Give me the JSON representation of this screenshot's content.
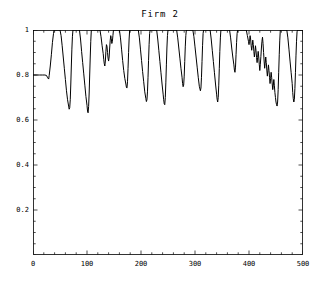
{
  "chart_data": {
    "type": "line",
    "title": "Firm 2",
    "xlabel": "",
    "ylabel": "",
    "xlim": [
      0,
      500
    ],
    "ylim": [
      0,
      1.0
    ],
    "grid": false,
    "legend": null,
    "line_color": "#000000",
    "background_color": "#ffffff",
    "frame_color": "#000000",
    "x_ticks": [
      0,
      100,
      200,
      300,
      400,
      500
    ],
    "x_tick_labels": [
      "0",
      "100",
      "200",
      "300",
      "400",
      "500"
    ],
    "x_minor_tick_step": 20,
    "y_ticks": [
      0.2,
      0.4,
      0.6,
      0.8,
      1.0
    ],
    "y_tick_labels": [
      "0.2",
      "0.4",
      "0.6",
      "0.8",
      "1"
    ],
    "y_minor_tick_step": 0.05,
    "series": [
      {
        "name": "Firm 2 capacity utilization",
        "points": [
          [
            0,
            0.8
          ],
          [
            6,
            0.8
          ],
          [
            12,
            0.8
          ],
          [
            18,
            0.8
          ],
          [
            22,
            0.8
          ],
          [
            25,
            0.798
          ],
          [
            27,
            0.788
          ],
          [
            29,
            0.782
          ],
          [
            30,
            0.798
          ],
          [
            32,
            0.84
          ],
          [
            34,
            0.89
          ],
          [
            36,
            0.945
          ],
          [
            38,
            0.985
          ],
          [
            39,
            1.0
          ],
          [
            42,
            1.0
          ],
          [
            46,
            1.0
          ],
          [
            50,
            1.0
          ],
          [
            52,
            0.975
          ],
          [
            54,
            0.93
          ],
          [
            56,
            0.88
          ],
          [
            58,
            0.83
          ],
          [
            60,
            0.78
          ],
          [
            62,
            0.73
          ],
          [
            64,
            0.69
          ],
          [
            66,
            0.662
          ],
          [
            67,
            0.648
          ],
          [
            68,
            0.655
          ],
          [
            69,
            0.69
          ],
          [
            70,
            0.76
          ],
          [
            71,
            0.84
          ],
          [
            72,
            0.915
          ],
          [
            73,
            0.97
          ],
          [
            74,
            1.0
          ],
          [
            78,
            1.0
          ],
          [
            82,
            1.0
          ],
          [
            86,
            1.0
          ],
          [
            88,
            0.96
          ],
          [
            90,
            0.905
          ],
          [
            92,
            0.855
          ],
          [
            94,
            0.805
          ],
          [
            96,
            0.755
          ],
          [
            98,
            0.705
          ],
          [
            100,
            0.665
          ],
          [
            101,
            0.64
          ],
          [
            102,
            0.632
          ],
          [
            103,
            0.66
          ],
          [
            104,
            0.72
          ],
          [
            105,
            0.8
          ],
          [
            106,
            0.88
          ],
          [
            107,
            0.95
          ],
          [
            108,
            1.0
          ],
          [
            112,
            1.0
          ],
          [
            116,
            1.0
          ],
          [
            120,
            1.0
          ],
          [
            124,
            1.0
          ],
          [
            126,
            0.97
          ],
          [
            128,
            0.93
          ],
          [
            130,
            0.895
          ],
          [
            131,
            0.87
          ],
          [
            132,
            0.85
          ],
          [
            133,
            0.84
          ],
          [
            134,
            0.862
          ],
          [
            135,
            0.905
          ],
          [
            136,
            0.935
          ],
          [
            137,
            0.928
          ],
          [
            138,
            0.9
          ],
          [
            139,
            0.875
          ],
          [
            140,
            0.862
          ],
          [
            141,
            0.88
          ],
          [
            142,
            0.92
          ],
          [
            143,
            0.955
          ],
          [
            144,
            0.975
          ],
          [
            145,
            0.962
          ],
          [
            146,
            0.94
          ],
          [
            147,
            0.95
          ],
          [
            148,
            0.975
          ],
          [
            149,
            1.0
          ],
          [
            152,
            1.0
          ],
          [
            156,
            1.0
          ],
          [
            160,
            1.0
          ],
          [
            162,
            0.965
          ],
          [
            164,
            0.915
          ],
          [
            166,
            0.865
          ],
          [
            168,
            0.82
          ],
          [
            170,
            0.785
          ],
          [
            172,
            0.76
          ],
          [
            173,
            0.745
          ],
          [
            174,
            0.742
          ],
          [
            175,
            0.77
          ],
          [
            176,
            0.83
          ],
          [
            177,
            0.9
          ],
          [
            178,
            0.96
          ],
          [
            179,
            1.0
          ],
          [
            183,
            1.0
          ],
          [
            187,
            1.0
          ],
          [
            191,
            1.0
          ],
          [
            195,
            1.0
          ],
          [
            197,
            0.965
          ],
          [
            199,
            0.915
          ],
          [
            201,
            0.865
          ],
          [
            203,
            0.815
          ],
          [
            205,
            0.77
          ],
          [
            207,
            0.725
          ],
          [
            209,
            0.695
          ],
          [
            210,
            0.682
          ],
          [
            211,
            0.69
          ],
          [
            212,
            0.725
          ],
          [
            213,
            0.79
          ],
          [
            214,
            0.865
          ],
          [
            215,
            0.935
          ],
          [
            216,
            0.985
          ],
          [
            217,
            1.0
          ],
          [
            221,
            1.0
          ],
          [
            225,
            1.0
          ],
          [
            229,
            1.0
          ],
          [
            231,
            0.96
          ],
          [
            233,
            0.91
          ],
          [
            235,
            0.86
          ],
          [
            237,
            0.81
          ],
          [
            239,
            0.76
          ],
          [
            241,
            0.715
          ],
          [
            242,
            0.69
          ],
          [
            243,
            0.672
          ],
          [
            244,
            0.668
          ],
          [
            245,
            0.7
          ],
          [
            246,
            0.765
          ],
          [
            247,
            0.845
          ],
          [
            248,
            0.92
          ],
          [
            249,
            0.975
          ],
          [
            250,
            1.0
          ],
          [
            254,
            1.0
          ],
          [
            258,
            1.0
          ],
          [
            262,
            1.0
          ],
          [
            266,
            1.0
          ],
          [
            268,
            0.965
          ],
          [
            270,
            0.92
          ],
          [
            272,
            0.875
          ],
          [
            274,
            0.83
          ],
          [
            276,
            0.79
          ],
          [
            277,
            0.762
          ],
          [
            278,
            0.748
          ],
          [
            279,
            0.755
          ],
          [
            280,
            0.795
          ],
          [
            281,
            0.86
          ],
          [
            282,
            0.925
          ],
          [
            283,
            0.975
          ],
          [
            284,
            1.0
          ],
          [
            288,
            1.0
          ],
          [
            292,
            1.0
          ],
          [
            296,
            1.0
          ],
          [
            298,
            0.97
          ],
          [
            300,
            0.925
          ],
          [
            302,
            0.88
          ],
          [
            304,
            0.835
          ],
          [
            306,
            0.79
          ],
          [
            308,
            0.75
          ],
          [
            310,
            0.73
          ],
          [
            311,
            0.742
          ],
          [
            312,
            0.79
          ],
          [
            313,
            0.86
          ],
          [
            314,
            0.93
          ],
          [
            315,
            0.985
          ],
          [
            316,
            1.0
          ],
          [
            320,
            1.0
          ],
          [
            324,
            1.0
          ],
          [
            328,
            1.0
          ],
          [
            330,
            0.96
          ],
          [
            332,
            0.91
          ],
          [
            334,
            0.86
          ],
          [
            336,
            0.81
          ],
          [
            338,
            0.76
          ],
          [
            340,
            0.715
          ],
          [
            341,
            0.692
          ],
          [
            342,
            0.68
          ],
          [
            343,
            0.7
          ],
          [
            344,
            0.755
          ],
          [
            345,
            0.83
          ],
          [
            346,
            0.905
          ],
          [
            347,
            0.965
          ],
          [
            348,
            1.0
          ],
          [
            352,
            1.0
          ],
          [
            356,
            1.0
          ],
          [
            360,
            1.0
          ],
          [
            364,
            1.0
          ],
          [
            366,
            0.965
          ],
          [
            368,
            0.92
          ],
          [
            370,
            0.88
          ],
          [
            372,
            0.845
          ],
          [
            373,
            0.822
          ],
          [
            374,
            0.812
          ],
          [
            375,
            0.835
          ],
          [
            376,
            0.89
          ],
          [
            377,
            0.945
          ],
          [
            378,
            0.985
          ],
          [
            379,
            1.0
          ],
          [
            383,
            1.0
          ],
          [
            387,
            1.0
          ],
          [
            391,
            1.0
          ],
          [
            395,
            1.0
          ],
          [
            397,
            0.975
          ],
          [
            399,
            0.95
          ],
          [
            400,
            0.935
          ],
          [
            401,
            0.95
          ],
          [
            402,
            0.975
          ],
          [
            403,
            0.96
          ],
          [
            404,
            0.93
          ],
          [
            405,
            0.91
          ],
          [
            406,
            0.93
          ],
          [
            407,
            0.955
          ],
          [
            408,
            0.935
          ],
          [
            409,
            0.905
          ],
          [
            410,
            0.88
          ],
          [
            411,
            0.902
          ],
          [
            412,
            0.93
          ],
          [
            413,
            0.908
          ],
          [
            414,
            0.878
          ],
          [
            415,
            0.855
          ],
          [
            416,
            0.878
          ],
          [
            417,
            0.905
          ],
          [
            418,
            0.88
          ],
          [
            419,
            0.848
          ],
          [
            420,
            0.82
          ],
          [
            421,
            0.848
          ],
          [
            422,
            0.882
          ],
          [
            423,
            0.92
          ],
          [
            424,
            0.95
          ],
          [
            425,
            0.968
          ],
          [
            426,
            0.94
          ],
          [
            427,
            0.9
          ],
          [
            428,
            0.862
          ],
          [
            429,
            0.83
          ],
          [
            430,
            0.852
          ],
          [
            431,
            0.88
          ],
          [
            432,
            0.855
          ],
          [
            433,
            0.822
          ],
          [
            434,
            0.795
          ],
          [
            435,
            0.818
          ],
          [
            436,
            0.845
          ],
          [
            437,
            0.82
          ],
          [
            438,
            0.79
          ],
          [
            439,
            0.762
          ],
          [
            440,
            0.785
          ],
          [
            441,
            0.812
          ],
          [
            442,
            0.788
          ],
          [
            443,
            0.76
          ],
          [
            444,
            0.735
          ],
          [
            445,
            0.755
          ],
          [
            446,
            0.78
          ],
          [
            447,
            0.752
          ],
          [
            448,
            0.722
          ],
          [
            449,
            0.7
          ],
          [
            450,
            0.68
          ],
          [
            451,
            0.668
          ],
          [
            452,
            0.662
          ],
          [
            453,
            0.68
          ],
          [
            454,
            0.735
          ],
          [
            455,
            0.812
          ],
          [
            456,
            0.89
          ],
          [
            457,
            0.955
          ],
          [
            458,
            1.0
          ],
          [
            462,
            1.0
          ],
          [
            466,
            1.0
          ],
          [
            470,
            1.0
          ],
          [
            472,
            0.965
          ],
          [
            474,
            0.915
          ],
          [
            476,
            0.862
          ],
          [
            478,
            0.812
          ],
          [
            480,
            0.762
          ],
          [
            481,
            0.722
          ],
          [
            482,
            0.695
          ],
          [
            483,
            0.68
          ],
          [
            484,
            0.692
          ],
          [
            485,
            0.74
          ],
          [
            486,
            0.81
          ],
          [
            487,
            0.885
          ],
          [
            488,
            0.95
          ],
          [
            489,
            0.992
          ],
          [
            490,
            1.0
          ],
          [
            494,
            1.0
          ],
          [
            498,
            1.0
          ],
          [
            500,
            1.0
          ]
        ]
      }
    ],
    "annotations": []
  }
}
